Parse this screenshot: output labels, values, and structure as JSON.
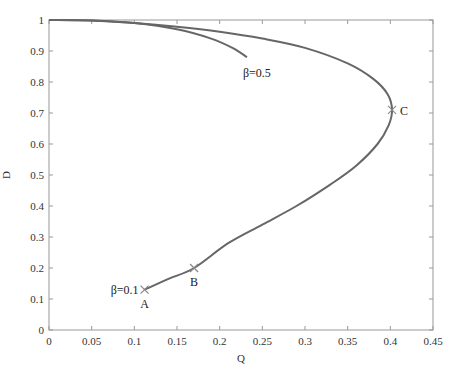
{
  "chart_data": {
    "type": "line",
    "title": "",
    "xlabel": "Q",
    "ylabel": "D",
    "xlim": [
      0,
      0.45
    ],
    "ylim": [
      0,
      1
    ],
    "grid": false,
    "legend": null,
    "x_ticks": [
      "0",
      "0.05",
      "0.1",
      "0.15",
      "0.2",
      "0.25",
      "0.3",
      "0.35",
      "0.4",
      "0.45"
    ],
    "y_ticks": [
      "0",
      "0.1",
      "0.2",
      "0.3",
      "0.4",
      "0.5",
      "0.6",
      "0.7",
      "0.8",
      "0.9",
      "1"
    ],
    "series": [
      {
        "name": "β=0.1",
        "points": [
          [
            0.0,
            1.0
          ],
          [
            0.05,
            0.998
          ],
          [
            0.1,
            0.99
          ],
          [
            0.15,
            0.978
          ],
          [
            0.2,
            0.962
          ],
          [
            0.25,
            0.94
          ],
          [
            0.3,
            0.91
          ],
          [
            0.35,
            0.86
          ],
          [
            0.38,
            0.81
          ],
          [
            0.397,
            0.76
          ],
          [
            0.402,
            0.71
          ],
          [
            0.398,
            0.66
          ],
          [
            0.385,
            0.6
          ],
          [
            0.36,
            0.53
          ],
          [
            0.33,
            0.47
          ],
          [
            0.29,
            0.4
          ],
          [
            0.25,
            0.34
          ],
          [
            0.21,
            0.28
          ],
          [
            0.17,
            0.2
          ],
          [
            0.14,
            0.165
          ],
          [
            0.112,
            0.13
          ]
        ]
      },
      {
        "name": "β=0.5",
        "points": [
          [
            0.0,
            1.0
          ],
          [
            0.05,
            0.998
          ],
          [
            0.1,
            0.99
          ],
          [
            0.15,
            0.97
          ],
          [
            0.19,
            0.94
          ],
          [
            0.215,
            0.91
          ],
          [
            0.232,
            0.88
          ]
        ]
      }
    ],
    "annotations": [
      {
        "label": "β=0.5",
        "x": 0.232,
        "y": 0.88
      },
      {
        "label": "β=0.1",
        "x": 0.112,
        "y": 0.13
      },
      {
        "label": "A",
        "x": 0.112,
        "y": 0.13,
        "marker": "x"
      },
      {
        "label": "B",
        "x": 0.17,
        "y": 0.2,
        "marker": "x"
      },
      {
        "label": "C",
        "x": 0.402,
        "y": 0.71,
        "marker": "x"
      }
    ],
    "line_color": "#666666",
    "marker_color": "#888888"
  }
}
